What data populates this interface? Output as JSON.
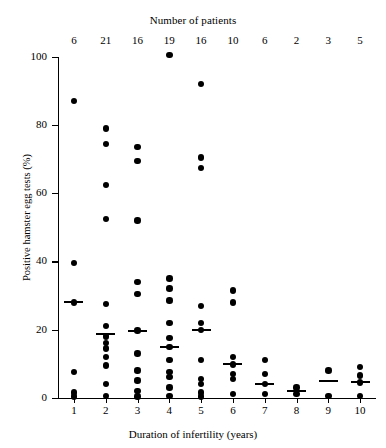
{
  "chart_data": {
    "type": "scatter",
    "title": "",
    "xlabel": "Duration of infertility (years)",
    "ylabel": "Positive hamster egg tests (%)",
    "top_axis_label": "Number of patients",
    "xlim": [
      0.5,
      10.5
    ],
    "ylim": [
      0,
      100
    ],
    "grid": false,
    "legend": null,
    "x_ticks": [
      "1",
      "2",
      "3",
      "4",
      "5",
      "6",
      "7",
      "8",
      "9",
      "10"
    ],
    "y_ticks": [
      "0",
      "20",
      "40",
      "60",
      "80",
      "100"
    ],
    "patient_counts": [
      "6",
      "21",
      "16",
      "19",
      "16",
      "10",
      "6",
      "2",
      "3",
      "5"
    ],
    "marker": "filled-circle",
    "marker_color": "#000000",
    "mean_marker": "horizontal-bar",
    "series": [
      {
        "name": "1",
        "x": 1,
        "mean": 28,
        "values": [
          87,
          39.5,
          28,
          7.5,
          1.5,
          0.3
        ]
      },
      {
        "name": "2",
        "x": 2,
        "mean": 18.7,
        "values": [
          79,
          74.5,
          62.5,
          52.5,
          27.5,
          21,
          18,
          16,
          14.5,
          12,
          9.5,
          4,
          0.5
        ]
      },
      {
        "name": "3",
        "x": 3,
        "mean": 19.7,
        "values": [
          73.5,
          69.5,
          52,
          34,
          30.5,
          19.7,
          13,
          8,
          5,
          2,
          0.3
        ]
      },
      {
        "name": "4",
        "x": 4,
        "mean": 14.8,
        "values": [
          100.5,
          35,
          32,
          28.5,
          22,
          17.5,
          14.8,
          11,
          7.5,
          6,
          3,
          0.5
        ]
      },
      {
        "name": "5",
        "x": 5,
        "mean": 19.8,
        "values": [
          92,
          70.5,
          67.5,
          27,
          22,
          19.8,
          11,
          5.5,
          4,
          1.5,
          0.3
        ]
      },
      {
        "name": "6",
        "x": 6,
        "mean": 9.8,
        "values": [
          31.5,
          28,
          12,
          9.8,
          7,
          5.5,
          1
        ]
      },
      {
        "name": "7",
        "x": 7,
        "mean": 4,
        "values": [
          11,
          7,
          4,
          1
        ]
      },
      {
        "name": "8",
        "x": 8,
        "mean": 2,
        "values": [
          3,
          1
        ]
      },
      {
        "name": "9",
        "x": 9,
        "mean": 5,
        "values": [
          8,
          0.5
        ]
      },
      {
        "name": "10",
        "x": 10,
        "mean": 4.5,
        "values": [
          9,
          6.5,
          4.5,
          0.5
        ]
      }
    ]
  }
}
